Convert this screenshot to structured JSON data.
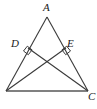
{
  "figure": {
    "width": 97,
    "height": 109,
    "background_color": "#ffffff",
    "stroke_color": "#3a3a3a",
    "base_stroke_color": "#808080",
    "label_color": "#1a1a1a"
  },
  "labels": {
    "apex": "A",
    "left_foot": "D",
    "right_foot": "E",
    "bottom_right": "C"
  },
  "points": {
    "A": {
      "x": 47,
      "y": 17
    },
    "B": {
      "x": 6,
      "y": 91
    },
    "C": {
      "x": 88,
      "y": 91
    },
    "D": {
      "x": 28,
      "y": 48
    },
    "E": {
      "x": 66,
      "y": 48
    },
    "O": {
      "x": 47,
      "y": 65
    }
  },
  "segments": [
    {
      "name": "side-AB",
      "from": "A",
      "to": "B"
    },
    {
      "name": "side-AC",
      "from": "A",
      "to": "C"
    },
    {
      "name": "side-BC",
      "from": "B",
      "to": "C"
    },
    {
      "name": "cevian-BE",
      "from": "B",
      "to": "E"
    },
    {
      "name": "cevian-CD",
      "from": "C",
      "to": "D"
    }
  ],
  "right_angle_marks": [
    {
      "name": "right-angle-at-D",
      "vertex": "D"
    },
    {
      "name": "right-angle-at-E",
      "vertex": "E"
    }
  ]
}
